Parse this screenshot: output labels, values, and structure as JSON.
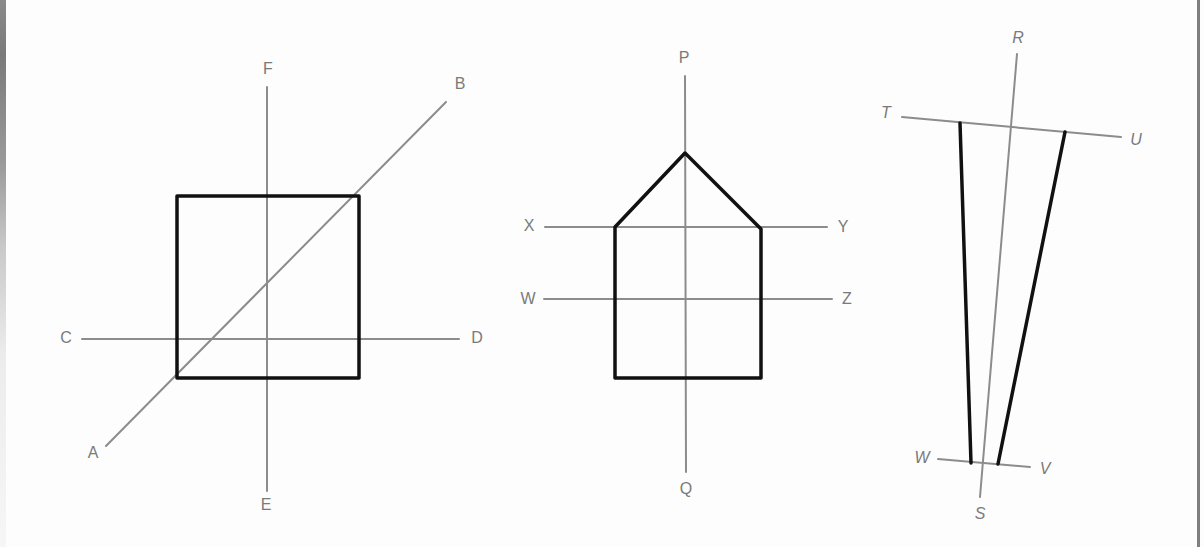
{
  "figures": [
    {
      "id": "square-figure",
      "description": "Square with horizontal axis C–D, vertical axis E–F and diagonal A–B",
      "shape": {
        "type": "square",
        "points": [
          [
            177,
            196
          ],
          [
            359,
            196
          ],
          [
            359,
            378
          ],
          [
            177,
            378
          ]
        ]
      },
      "lines": [
        {
          "name": "A-B",
          "from": [
            106,
            446
          ],
          "to": [
            446,
            102
          ]
        },
        {
          "name": "C-D",
          "from": [
            82,
            339
          ],
          "to": [
            459,
            339
          ]
        },
        {
          "name": "E-F",
          "from": [
            267,
            491
          ],
          "to": [
            267,
            87
          ]
        }
      ],
      "labels": {
        "A": {
          "text": "A",
          "x": 93,
          "y": 454
        },
        "B": {
          "text": "B",
          "x": 460,
          "y": 85
        },
        "C": {
          "text": "C",
          "x": 66,
          "y": 339
        },
        "D": {
          "text": "D",
          "x": 477,
          "y": 339
        },
        "E": {
          "text": "E",
          "x": 266,
          "y": 506
        },
        "F": {
          "text": "F",
          "x": 268,
          "y": 70
        }
      }
    },
    {
      "id": "house-figure",
      "description": "Pentagon (house shape) with vertical axis P–Q and horizontal lines X–Y and W–Z",
      "shape": {
        "type": "pentagon",
        "points": [
          [
            685,
            153
          ],
          [
            761,
            229
          ],
          [
            761,
            378
          ],
          [
            615,
            378
          ],
          [
            615,
            227
          ]
        ]
      },
      "lines": [
        {
          "name": "P-Q",
          "from": [
            685,
            76
          ],
          "to": [
            686,
            472
          ]
        },
        {
          "name": "X-Y",
          "from": [
            545,
            227
          ],
          "to": [
            827,
            227
          ]
        },
        {
          "name": "W-Z",
          "from": [
            544,
            299
          ],
          "to": [
            832,
            299
          ]
        }
      ],
      "labels": {
        "P": {
          "text": "P",
          "x": 684,
          "y": 59
        },
        "Q": {
          "text": "Q",
          "x": 686,
          "y": 490
        },
        "X": {
          "text": "X",
          "x": 529,
          "y": 227
        },
        "Y": {
          "text": "Y",
          "x": 843,
          "y": 228
        },
        "W": {
          "text": "W",
          "x": 528,
          "y": 300
        },
        "Z": {
          "text": "Z",
          "x": 847,
          "y": 300
        }
      }
    },
    {
      "id": "trapezoid-figure",
      "description": "Tapered trapezoid with slanted axis R–S and cross lines T–U and W–V",
      "shape": {
        "type": "trapezoid",
        "points": [
          [
            960,
            123
          ],
          [
            1065,
            132
          ],
          [
            998,
            464
          ],
          [
            971,
            463
          ]
        ]
      },
      "lines": [
        {
          "name": "R-S",
          "from": [
            1017,
            54
          ],
          "to": [
            980,
            497
          ]
        },
        {
          "name": "T-U",
          "from": [
            902,
            117
          ],
          "to": [
            1121,
            137
          ]
        },
        {
          "name": "W-V",
          "from": [
            938,
            459
          ],
          "to": [
            1030,
            467
          ]
        }
      ],
      "labels": {
        "R": {
          "text": "R",
          "x": 1018,
          "y": 39
        },
        "S": {
          "text": "S",
          "x": 980,
          "y": 515
        },
        "T": {
          "text": "T",
          "x": 886,
          "y": 114
        },
        "U": {
          "text": "U",
          "x": 1136,
          "y": 141
        },
        "W": {
          "text": "W",
          "x": 922,
          "y": 459
        },
        "V": {
          "text": "V",
          "x": 1045,
          "y": 470
        }
      }
    }
  ],
  "colors": {
    "guide_line": "#8c8c8c",
    "shape_outline": "#111111",
    "label_text": "#7a7a7a",
    "background": "#fdfdfd"
  }
}
